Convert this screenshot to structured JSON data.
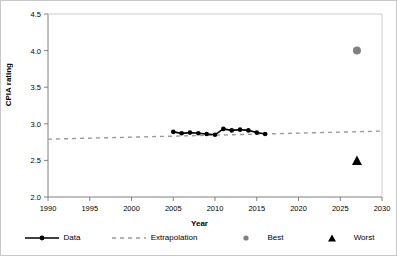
{
  "chart_data": {
    "type": "line",
    "title": "",
    "xlabel": "Year",
    "ylabel": "CPIA rating",
    "xlim": [
      1990,
      2030
    ],
    "ylim": [
      2.0,
      4.5
    ],
    "xticks": [
      1990,
      1995,
      2000,
      2005,
      2010,
      2015,
      2020,
      2025,
      2030
    ],
    "yticks": [
      "2.0",
      "2.5",
      "3.0",
      "3.5",
      "4.0",
      "4.5"
    ],
    "grid": false,
    "legend_position": "bottom",
    "series": [
      {
        "name": "Data",
        "type": "line",
        "color": "#000000",
        "marker": "circle",
        "x": [
          2005,
          2006,
          2007,
          2008,
          2009,
          2010,
          2011,
          2012,
          2013,
          2014,
          2015,
          2016
        ],
        "values": [
          2.89,
          2.87,
          2.88,
          2.87,
          2.86,
          2.85,
          2.93,
          2.91,
          2.92,
          2.91,
          2.88,
          2.86
        ]
      },
      {
        "name": "Extrapolation",
        "type": "line",
        "style": "dashed",
        "color": "#9a9a9a",
        "x": [
          1990,
          2030
        ],
        "values": [
          2.79,
          2.9
        ]
      },
      {
        "name": "Best",
        "type": "scatter",
        "color": "#808080",
        "marker": "circle",
        "x": [
          2027
        ],
        "values": [
          4.0
        ]
      },
      {
        "name": "Worst",
        "type": "scatter",
        "color": "#000000",
        "marker": "triangle",
        "x": [
          2027
        ],
        "values": [
          2.5
        ]
      }
    ]
  },
  "axes": {
    "y_title": "CPIA rating",
    "x_title": "Year",
    "y_tick_labels": [
      "4.5",
      "4.0",
      "3.5",
      "3.0",
      "2.5",
      "2.0"
    ],
    "x_tick_labels": [
      "1990",
      "1995",
      "2000",
      "2005",
      "2010",
      "2015",
      "2020",
      "2025",
      "2030"
    ]
  },
  "legend": {
    "items": [
      {
        "label": "Data",
        "icon": "solid-line-with-marker-icon"
      },
      {
        "label": "Extrapolation",
        "icon": "dashed-line-icon"
      },
      {
        "label": "Best",
        "icon": "gray-circle-marker-icon"
      },
      {
        "label": "Worst",
        "icon": "black-triangle-marker-icon"
      }
    ]
  },
  "colors": {
    "data_line": "#000000",
    "extrapolation_line": "#9a9a9a",
    "best_marker": "#808080",
    "worst_marker": "#000000",
    "axis": "#808080",
    "frame": "#c8c8c8"
  }
}
